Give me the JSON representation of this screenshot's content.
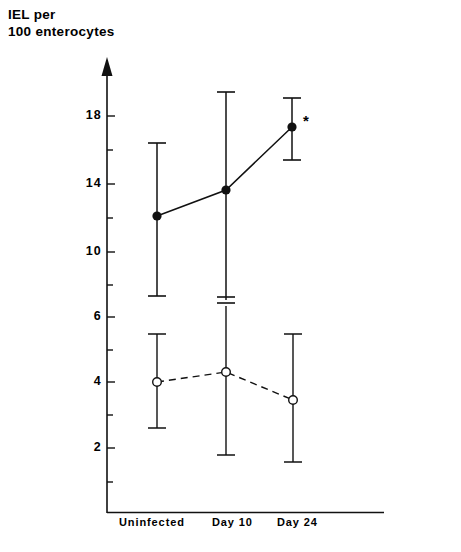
{
  "axis_title": "IEL per\n100 enterocytes",
  "chart_data": {
    "type": "line",
    "title": "IEL per 100 enterocytes",
    "xlabel": "",
    "ylabel": "IEL per 100 enterocytes",
    "categories": [
      "Uninfected",
      "Day 10",
      "Day 24"
    ],
    "ytick_labels": [
      "18",
      "14",
      "10",
      "6",
      "4",
      "2"
    ],
    "ytick_values": [
      18,
      14,
      10,
      6,
      4,
      2
    ],
    "ylim": [
      0,
      20
    ],
    "grid": false,
    "legend": "none",
    "series": [
      {
        "name": "infected-series",
        "marker": "filled-circle",
        "line_style": "solid",
        "values": [
          12.1,
          13.6,
          17.2
        ],
        "error_upper": [
          16.3,
          20.2,
          18.6
        ],
        "error_lower": [
          7.4,
          6.8,
          15.4
        ],
        "annotations": [
          "",
          "",
          "*"
        ]
      },
      {
        "name": "control-series",
        "marker": "open-circle",
        "line_style": "dashed",
        "values": [
          4.0,
          4.4,
          3.4
        ],
        "error_upper": [
          5.1,
          6.5,
          5.1
        ],
        "error_lower": [
          2.7,
          1.9,
          1.6
        ],
        "annotations": [
          "",
          "",
          ""
        ]
      }
    ],
    "significance_marker": "*",
    "axis_break_note": "break-mark-on-day10-upper-bar"
  },
  "ticks": {
    "y": [
      {
        "label": "18",
        "top": 108
      },
      {
        "label": "14",
        "top": 176
      },
      {
        "label": "10",
        "top": 244
      },
      {
        "label": "6",
        "top": 309
      },
      {
        "label": "4",
        "top": 374
      },
      {
        "label": "2",
        "top": 440
      }
    ],
    "x": [
      {
        "label": "Uninfected",
        "left": 119
      },
      {
        "label": "Day 10",
        "left": 212
      },
      {
        "label": "Day 24",
        "left": 277
      }
    ]
  },
  "colors": {
    "ink": "#111111",
    "background": "#ffffff"
  }
}
